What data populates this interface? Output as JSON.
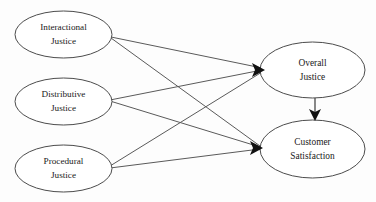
{
  "diagram": {
    "type": "path-diagram",
    "background_color": "#fdfdfd",
    "node_fill_color": "#ffffff",
    "node_stroke_color": "#4c4c4c",
    "edge_color": "#5a5a5a",
    "arrow_color": "#111111",
    "nodes": [
      {
        "id": "interactional-justice",
        "label_line1": "Interactional",
        "label_line2": "Justice",
        "cx": 63.5,
        "cy": 34.5,
        "rx": 48.5,
        "ry": 23.5,
        "role": "exogenous"
      },
      {
        "id": "distributive-justice",
        "label_line1": "Distributive",
        "label_line2": "Justice",
        "cx": 63.5,
        "cy": 101.5,
        "rx": 48.5,
        "ry": 23.5,
        "role": "exogenous"
      },
      {
        "id": "procedural-justice",
        "label_line1": "Procedural",
        "label_line2": "Justice",
        "cx": 63.5,
        "cy": 168.5,
        "rx": 48.5,
        "ry": 23.5,
        "role": "exogenous"
      },
      {
        "id": "overall-justice",
        "label_line1": "Overall",
        "label_line2": "Justice",
        "cx": 312.5,
        "cy": 70,
        "rx": 52.5,
        "ry": 28,
        "role": "mediator"
      },
      {
        "id": "customer-satisfaction",
        "label_line1": "Customer",
        "label_line2": "Satisfaction",
        "cx": 312.5,
        "cy": 149,
        "rx": 52.5,
        "ry": 29,
        "role": "endogenous"
      }
    ],
    "edges": [
      {
        "id": "interactional-to-overall",
        "from": "interactional-justice",
        "to": "overall-justice",
        "x1": 111,
        "y1": 37,
        "x2": 262,
        "y2": 68
      },
      {
        "id": "interactional-to-satisfaction",
        "from": "interactional-justice",
        "to": "customer-satisfaction",
        "x1": 111,
        "y1": 38,
        "x2": 260,
        "y2": 146
      },
      {
        "id": "distributive-to-overall",
        "from": "distributive-justice",
        "to": "overall-justice",
        "x1": 110,
        "y1": 100,
        "x2": 262,
        "y2": 70
      },
      {
        "id": "distributive-to-satisfaction",
        "from": "distributive-justice",
        "to": "customer-satisfaction",
        "x1": 110,
        "y1": 101,
        "x2": 260,
        "y2": 147
      },
      {
        "id": "procedural-to-overall",
        "from": "procedural-justice",
        "to": "overall-justice",
        "x1": 110,
        "y1": 166,
        "x2": 262,
        "y2": 72
      },
      {
        "id": "procedural-to-satisfaction",
        "from": "procedural-justice",
        "to": "customer-satisfaction",
        "x1": 110,
        "y1": 168,
        "x2": 260,
        "y2": 149
      },
      {
        "id": "overall-to-satisfaction",
        "from": "overall-justice",
        "to": "customer-satisfaction",
        "x1": 315,
        "y1": 98,
        "x2": 315,
        "y2": 118,
        "orientation": "vertical"
      }
    ],
    "arrowheads": [
      {
        "id": "arrowhead-overall-justice",
        "target": "overall-justice",
        "tip_x": 264,
        "tip_y": 70
      },
      {
        "id": "arrowhead-customer-satisfaction",
        "target": "customer-satisfaction",
        "tip_x": 262,
        "tip_y": 148
      },
      {
        "id": "arrowhead-vertical",
        "target": "customer-satisfaction",
        "tip_x": 315,
        "tip_y": 120
      }
    ]
  }
}
